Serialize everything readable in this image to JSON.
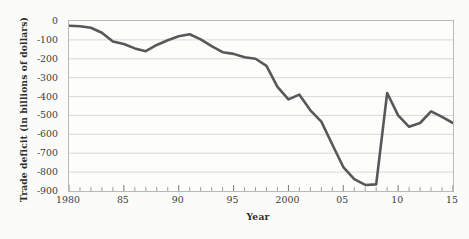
{
  "chart_data": {
    "type": "line",
    "title": "",
    "xlabel": "Year",
    "ylabel": "Trade deficit (in billions of dollars)",
    "xlim": [
      1980,
      2015
    ],
    "ylim": [
      -900,
      0
    ],
    "grid": true,
    "legend": null,
    "legend_position": "none",
    "line_color": "#585858",
    "x_tick_labels": [
      "1980",
      "85",
      "90",
      "95",
      "2000",
      "05",
      "10",
      "15"
    ],
    "x_tick_values": [
      1980,
      1985,
      1990,
      1995,
      2000,
      2005,
      2010,
      2015
    ],
    "x_minor_tick_step": 1,
    "y_tick_labels": [
      "0",
      "-100",
      "-200",
      "-300",
      "-400",
      "-500",
      "-600",
      "-700",
      "-800",
      "-900"
    ],
    "y_tick_values": [
      0,
      -100,
      -200,
      -300,
      -400,
      -500,
      -600,
      -700,
      -800,
      -900
    ],
    "x": [
      1980,
      1981,
      1982,
      1983,
      1984,
      1985,
      1986,
      1987,
      1988,
      1989,
      1990,
      1991,
      1992,
      1993,
      1994,
      1995,
      1996,
      1997,
      1998,
      1999,
      2000,
      2001,
      2002,
      2003,
      2004,
      2005,
      2006,
      2007,
      2008,
      2009,
      2010,
      2011,
      2012,
      2013,
      2014,
      2015
    ],
    "values": [
      -25,
      -28,
      -36,
      -62,
      -108,
      -122,
      -145,
      -160,
      -127,
      -102,
      -81,
      -70,
      -97,
      -133,
      -165,
      -174,
      -192,
      -200,
      -238,
      -349,
      -415,
      -390,
      -473,
      -533,
      -654,
      -773,
      -837,
      -868,
      -865,
      -381,
      -500,
      -560,
      -540,
      -478,
      -508,
      -540
    ],
    "series": [
      {
        "name": "U.S. trade deficit",
        "color": "#585858",
        "values": [
          -25,
          -28,
          -36,
          -62,
          -108,
          -122,
          -145,
          -160,
          -127,
          -102,
          -81,
          -70,
          -97,
          -133,
          -165,
          -174,
          -192,
          -200,
          -238,
          -349,
          -415,
          -390,
          -473,
          -533,
          -654,
          -773,
          -837,
          -868,
          -865,
          -381,
          -500,
          -560,
          -540,
          -478,
          -508,
          -540
        ]
      }
    ],
    "annotations": []
  }
}
